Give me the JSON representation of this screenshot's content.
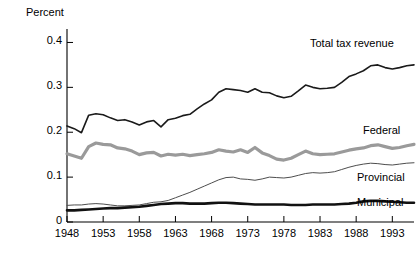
{
  "chart_data": {
    "type": "line",
    "title": "",
    "subtitle": "",
    "ylabel": "Percent",
    "xlabel": "",
    "ylim": [
      0,
      0.43
    ],
    "xlim": [
      1948,
      1996
    ],
    "grid": false,
    "legend_position": "inline-right",
    "y_ticks": [
      "0.4",
      "0.3",
      "0.2",
      "0.1",
      "0"
    ],
    "y_tick_values": [
      0.4,
      0.3,
      0.2,
      0.1,
      0
    ],
    "x_ticks": [
      "1948",
      "1953",
      "1958",
      "1963",
      "1968",
      "1973",
      "1978",
      "1983",
      "1988",
      "1993"
    ],
    "x_tick_values": [
      1948,
      1953,
      1958,
      1963,
      1968,
      1973,
      1978,
      1983,
      1988,
      1993
    ],
    "x": [
      1948,
      1949,
      1950,
      1951,
      1952,
      1953,
      1954,
      1955,
      1956,
      1957,
      1958,
      1959,
      1960,
      1961,
      1962,
      1963,
      1964,
      1965,
      1966,
      1967,
      1968,
      1969,
      1970,
      1971,
      1972,
      1973,
      1974,
      1975,
      1976,
      1977,
      1978,
      1979,
      1980,
      1981,
      1982,
      1983,
      1984,
      1985,
      1986,
      1987,
      1988,
      1989,
      1990,
      1991,
      1992,
      1993,
      1994,
      1995,
      1996
    ],
    "series": [
      {
        "name": "Total tax revenue",
        "color": "#1a1a1a",
        "width": 1.6,
        "values": [
          0.214,
          0.208,
          0.199,
          0.238,
          0.241,
          0.239,
          0.232,
          0.226,
          0.228,
          0.223,
          0.216,
          0.223,
          0.226,
          0.212,
          0.228,
          0.231,
          0.237,
          0.24,
          0.252,
          0.263,
          0.272,
          0.289,
          0.297,
          0.295,
          0.293,
          0.289,
          0.297,
          0.289,
          0.288,
          0.281,
          0.277,
          0.28,
          0.292,
          0.305,
          0.3,
          0.297,
          0.298,
          0.3,
          0.311,
          0.324,
          0.33,
          0.337,
          0.348,
          0.35,
          0.344,
          0.341,
          0.344,
          0.348,
          0.35
        ]
      },
      {
        "name": "Federal",
        "color": "#9a9a9a",
        "width": 3.2,
        "values": [
          0.152,
          0.147,
          0.142,
          0.168,
          0.176,
          0.173,
          0.172,
          0.165,
          0.163,
          0.158,
          0.15,
          0.154,
          0.155,
          0.147,
          0.151,
          0.149,
          0.151,
          0.148,
          0.15,
          0.152,
          0.155,
          0.161,
          0.158,
          0.156,
          0.161,
          0.155,
          0.166,
          0.154,
          0.148,
          0.14,
          0.138,
          0.142,
          0.15,
          0.158,
          0.152,
          0.15,
          0.151,
          0.152,
          0.156,
          0.16,
          0.163,
          0.165,
          0.17,
          0.172,
          0.168,
          0.164,
          0.166,
          0.17,
          0.173
        ]
      },
      {
        "name": "Provincial",
        "color": "#4d4d4d",
        "width": 1.0,
        "values": [
          0.037,
          0.038,
          0.038,
          0.04,
          0.041,
          0.04,
          0.038,
          0.036,
          0.036,
          0.037,
          0.038,
          0.041,
          0.044,
          0.045,
          0.048,
          0.054,
          0.06,
          0.066,
          0.073,
          0.08,
          0.087,
          0.094,
          0.099,
          0.1,
          0.096,
          0.095,
          0.093,
          0.096,
          0.1,
          0.099,
          0.098,
          0.1,
          0.104,
          0.108,
          0.11,
          0.109,
          0.11,
          0.112,
          0.117,
          0.122,
          0.126,
          0.129,
          0.131,
          0.13,
          0.128,
          0.127,
          0.129,
          0.131,
          0.132
        ]
      },
      {
        "name": "Municipal",
        "color": "#111111",
        "width": 2.6,
        "values": [
          0.026,
          0.026,
          0.027,
          0.028,
          0.029,
          0.03,
          0.031,
          0.031,
          0.032,
          0.033,
          0.034,
          0.036,
          0.038,
          0.04,
          0.041,
          0.042,
          0.042,
          0.041,
          0.041,
          0.041,
          0.042,
          0.043,
          0.043,
          0.042,
          0.041,
          0.04,
          0.039,
          0.039,
          0.039,
          0.039,
          0.039,
          0.038,
          0.038,
          0.038,
          0.039,
          0.039,
          0.039,
          0.039,
          0.04,
          0.041,
          0.043,
          0.046,
          0.047,
          0.047,
          0.046,
          0.045,
          0.044,
          0.043,
          0.043
        ]
      }
    ],
    "annotations": [
      {
        "text": "Total tax revenue",
        "x_px": 310,
        "y_px": 37
      },
      {
        "text": "Federal",
        "x_px": 363,
        "y_px": 124
      },
      {
        "text": "Provincial",
        "x_px": 357,
        "y_px": 171
      },
      {
        "text": "Municipal",
        "x_px": 357,
        "y_px": 196
      }
    ]
  },
  "axes": {
    "y_axis_title": "Percent"
  }
}
